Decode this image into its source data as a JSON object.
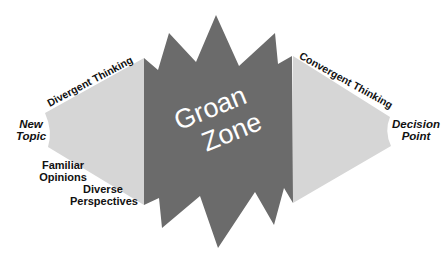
{
  "diagram": {
    "center_label_line1": "Groan",
    "center_label_line2": "Zone",
    "left_flow_label": "Divergent Thinking",
    "right_flow_label": "Convergent Thinking",
    "start": {
      "line1": "New",
      "line2": "Topic"
    },
    "end": {
      "line1": "Decision",
      "line2": "Point"
    },
    "stages": [
      {
        "line1": "Familiar",
        "line2": "Opinions"
      },
      {
        "line1": "Diverse",
        "line2": "Perspectives"
      }
    ]
  },
  "colors": {
    "groan_zone_fill": "#6b6b6b",
    "divergence_fill": "#d6d6d6",
    "convergence_fill": "#d6d6d6",
    "center_text": "#ffffff",
    "label_text": "#111111"
  }
}
